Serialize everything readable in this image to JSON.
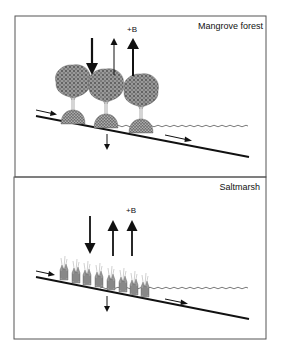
{
  "figure": {
    "panels": [
      {
        "id": "mangrove",
        "title": "Mangrove forest",
        "biomass_label": "+B",
        "vegetation": "mangrove-trees",
        "vegetation_count": 3,
        "arrows": {
          "down_deposition": "thick",
          "up_left": "thin",
          "up_biomass": "thick",
          "below_ground_down": "thin",
          "inflow_left": "thin",
          "outflow_right": "thin"
        }
      },
      {
        "id": "saltmarsh",
        "title": "Saltmarsh",
        "biomass_label": "+B",
        "vegetation": "saltmarsh-grass",
        "vegetation_count": 8,
        "arrows": {
          "down_deposition": "thick",
          "up_left": "thick",
          "up_biomass": "thick",
          "below_ground_down": "thin",
          "inflow_left": "thin",
          "outflow_right": "thin"
        }
      }
    ],
    "colors": {
      "border": "#555555",
      "ink": "#111111",
      "vegetation": "#6a6a6a",
      "water": "#444444"
    }
  }
}
